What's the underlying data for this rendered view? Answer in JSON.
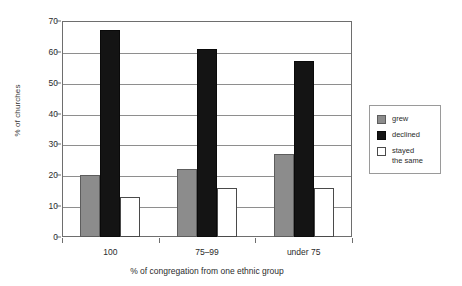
{
  "chart_data": {
    "type": "bar",
    "title": "",
    "subtitle": "",
    "xlabel": "% of congregation from one ethnic group",
    "ylabel": "% of churches",
    "categories": [
      "100",
      "75–99",
      "under 75"
    ],
    "series": [
      {
        "name": "grew",
        "values": [
          20,
          22,
          27
        ],
        "color": "#8c8c8c"
      },
      {
        "name": "declined",
        "values": [
          67,
          61,
          57
        ],
        "color": "#141414"
      },
      {
        "name": "stayed the same",
        "values": [
          13,
          16,
          16
        ],
        "color": "#ffffff"
      }
    ],
    "ylim": [
      0,
      70
    ],
    "yticks": [
      0,
      10,
      20,
      30,
      40,
      50,
      60,
      70
    ],
    "ytick_labels": [
      "0",
      "10",
      "20",
      "30",
      "40",
      "50",
      "60",
      "70"
    ],
    "grid": "horizontal",
    "legend_position": "right"
  },
  "legend": {
    "items": [
      {
        "label": "grew",
        "swatch": "grew-swatch"
      },
      {
        "label": "declined",
        "swatch": "declined-swatch"
      },
      {
        "label": "stayed\nthe same",
        "swatch": "stayed-swatch"
      }
    ]
  }
}
